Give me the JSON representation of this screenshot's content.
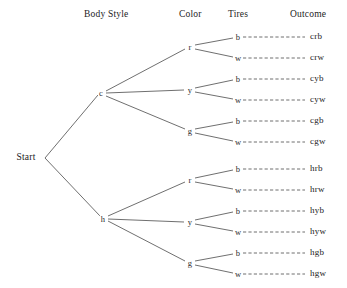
{
  "diagram": {
    "type": "probability-tree",
    "title": "",
    "root": {
      "label": "Start",
      "x": 26,
      "y": 158
    },
    "headers": [
      {
        "label": "Body Style",
        "x": 84,
        "y": 9
      },
      {
        "label": "Color",
        "x": 179,
        "y": 9
      },
      {
        "label": "Tires",
        "x": 228,
        "y": 9
      },
      {
        "label": "Outcome",
        "x": 290,
        "y": 9
      }
    ],
    "levels": [
      "Body Style",
      "Color",
      "Tires",
      "Outcome"
    ],
    "body_styles": [
      {
        "label": "c",
        "x": 101,
        "y": 93
      },
      {
        "label": "h",
        "x": 103,
        "y": 219
      }
    ],
    "colors": [
      {
        "label": "r",
        "x": 190,
        "y": 47
      },
      {
        "label": "y",
        "x": 190,
        "y": 90
      },
      {
        "label": "g",
        "x": 190,
        "y": 131
      },
      {
        "label": "r",
        "x": 190,
        "y": 180
      },
      {
        "label": "y",
        "x": 190,
        "y": 222
      },
      {
        "label": "g",
        "x": 190,
        "y": 263
      }
    ],
    "tires": [
      {
        "label": "b",
        "x": 238,
        "y": 37
      },
      {
        "label": "w",
        "x": 238,
        "y": 58
      },
      {
        "label": "b",
        "x": 238,
        "y": 79
      },
      {
        "label": "w",
        "x": 238,
        "y": 100
      },
      {
        "label": "b",
        "x": 238,
        "y": 121
      },
      {
        "label": "w",
        "x": 238,
        "y": 142
      },
      {
        "label": "b",
        "x": 238,
        "y": 169
      },
      {
        "label": "w",
        "x": 238,
        "y": 190
      },
      {
        "label": "b",
        "x": 238,
        "y": 211
      },
      {
        "label": "w",
        "x": 238,
        "y": 232
      },
      {
        "label": "b",
        "x": 238,
        "y": 253
      },
      {
        "label": "w",
        "x": 238,
        "y": 274
      }
    ],
    "outcomes": [
      {
        "label": "crb",
        "x": 310,
        "y": 37
      },
      {
        "label": "crw",
        "x": 310,
        "y": 58
      },
      {
        "label": "cyb",
        "x": 310,
        "y": 79
      },
      {
        "label": "cyw",
        "x": 310,
        "y": 100
      },
      {
        "label": "cgb",
        "x": 310,
        "y": 121
      },
      {
        "label": "cgw",
        "x": 310,
        "y": 142
      },
      {
        "label": "hrb",
        "x": 310,
        "y": 169
      },
      {
        "label": "hrw",
        "x": 310,
        "y": 190
      },
      {
        "label": "hyb",
        "x": 310,
        "y": 211
      },
      {
        "label": "hyw",
        "x": 310,
        "y": 232
      },
      {
        "label": "hgb",
        "x": 310,
        "y": 253
      },
      {
        "label": "hgw",
        "x": 310,
        "y": 274
      }
    ],
    "edges_solid": [
      "M 45,158 L 98,95",
      "M 45,158 L 100,216",
      "M 106,91 L 185,49",
      "M 106,93 L 184,90",
      "M 106,96 L 185,129",
      "M 108,216 L 185,182",
      "M 108,219 L 184,222",
      "M 108,221 L 185,261",
      "M 195,45 L 233,38",
      "M 195,49 L 233,57",
      "M 195,88 L 233,80",
      "M 195,92 L 233,99",
      "M 195,129 L 233,122",
      "M 195,133 L 233,141",
      "M 195,178 L 233,170",
      "M 195,182 L 233,189",
      "M 195,220 L 233,212",
      "M 195,224 L 233,231",
      "M 195,261 L 233,254",
      "M 195,265 L 233,273"
    ],
    "edges_dashed": [
      "M 243,37 L 305,37",
      "M 243,58 L 305,58",
      "M 243,79 L 305,79",
      "M 243,100 L 305,100",
      "M 243,121 L 305,121",
      "M 243,142 L 305,142",
      "M 243,169 L 305,169",
      "M 243,190 L 305,190",
      "M 243,211 L 305,211",
      "M 243,232 L 305,232",
      "M 243,253 L 305,253",
      "M 243,274 L 305,274"
    ],
    "colors_hex": {
      "line": "#4a4a4a",
      "text": "#232323",
      "background": "#ffffff"
    }
  }
}
